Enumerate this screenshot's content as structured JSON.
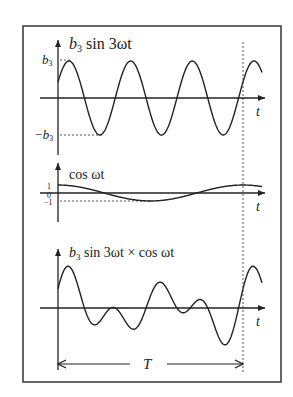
{
  "panels": [
    {
      "title_main": "b",
      "title_sub": "3",
      "title_rest": " sin 3ωt",
      "tick_pos_main": "b",
      "tick_pos_sub": "3",
      "tick_neg_main": "−b",
      "tick_neg_sub": "3",
      "axis_label": "t"
    },
    {
      "title": "cos ωt",
      "tick_pos": "1",
      "tick_zero": "0",
      "tick_neg": "−1",
      "axis_label": "t"
    },
    {
      "title_main": "b",
      "title_sub": "3",
      "title_rest": " sin 3ωt × cos ωt",
      "axis_label": "t"
    }
  ],
  "period_label": "T",
  "colors": {
    "line": "#222222",
    "frame": "#333333",
    "background": "#ffffff"
  }
}
